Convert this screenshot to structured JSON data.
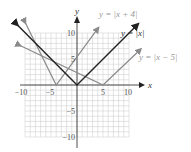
{
  "chart_data": {
    "type": "line",
    "title": "",
    "xlabel": "x",
    "ylabel": "y",
    "xlim": [
      -10,
      10
    ],
    "ylim": [
      -10,
      10
    ],
    "grid": true,
    "x_ticks": [
      "-10",
      "-5",
      "5",
      "10"
    ],
    "y_ticks": [
      "10",
      "5",
      "-5",
      "-10"
    ],
    "series": [
      {
        "name": "y = |x|",
        "vertex": [
          0,
          0
        ],
        "color": "#2a2a2a",
        "points": [
          [
            -12,
            12
          ],
          [
            0,
            0
          ],
          [
            12,
            12
          ]
        ]
      },
      {
        "name": "y = |x + 4|",
        "vertex": [
          -4,
          0
        ],
        "color": "#8a8a8a",
        "points": [
          [
            -16,
            12
          ],
          [
            -4,
            0
          ],
          [
            8,
            12
          ]
        ]
      },
      {
        "name": "y = |x - 5|",
        "vertex": [
          5,
          0
        ],
        "color": "#8a8a8a",
        "points": [
          [
            -7,
            12
          ],
          [
            5,
            0
          ],
          [
            12,
            7
          ]
        ]
      }
    ],
    "annotations": [
      "y = |x + 4|",
      "y = |x|",
      "y = |x − 5|"
    ]
  },
  "labels": {
    "x_axis": "x",
    "y_axis": "y",
    "tick_x_neg10": "−10",
    "tick_x_neg5": "−5",
    "tick_x_5": "5",
    "tick_x_10": "10",
    "tick_y_10": "10",
    "tick_y_5": "5",
    "tick_y_neg5": "−5",
    "tick_y_neg10": "−10",
    "eq_plus4": "y = |x + 4|",
    "eq_abs": "y = |x|",
    "eq_minus5": "y = |x − 5|"
  }
}
